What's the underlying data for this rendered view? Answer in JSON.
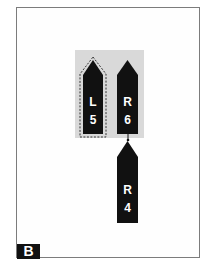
{
  "figure": {
    "panel_label": "B",
    "colors": {
      "piece_fill": "#111111",
      "group_background": "#d9d9d9",
      "frame_border": "#7c7c7c",
      "text": "#ffffff"
    },
    "group": {
      "pieces": [
        {
          "id": "L5",
          "side": "L",
          "number": "5",
          "selected": true,
          "outline": "dashed"
        },
        {
          "id": "R6",
          "side": "R",
          "number": "6",
          "selected": false
        }
      ]
    },
    "attached": [
      {
        "id": "R4",
        "side": "R",
        "number": "4",
        "attached_to": "R6"
      }
    ]
  }
}
